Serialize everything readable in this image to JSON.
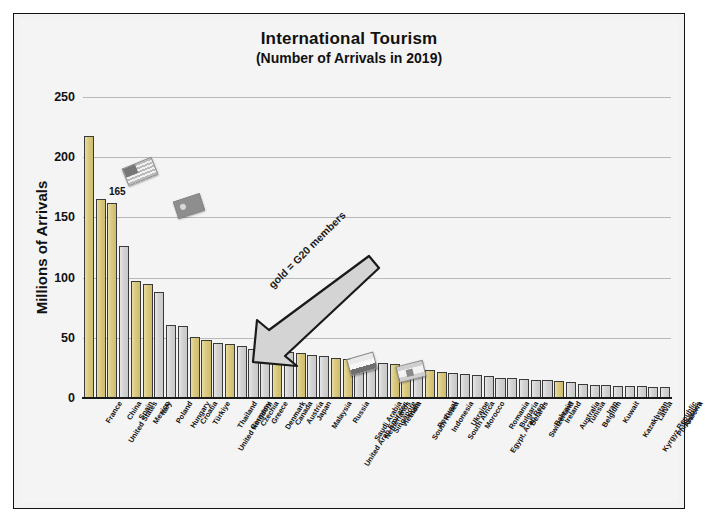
{
  "chart_data": {
    "type": "bar",
    "title": "International Tourism",
    "subtitle": "(Number of Arrivals in 2019)",
    "xlabel": "",
    "ylabel": "Millions of Arrivals",
    "ylim": [
      0,
      250
    ],
    "yticks": [
      0,
      50,
      100,
      150,
      200,
      250
    ],
    "grid": true,
    "legend": false,
    "annotations": [
      {
        "name": "arrow-note",
        "text": "gold = G20 members"
      },
      {
        "name": "data-label-united-states",
        "text": "165",
        "series_index": 1
      }
    ],
    "categories": [
      "France",
      "United States",
      "China",
      "Spain",
      "Mexico",
      "Italy",
      "Poland",
      "Hungary",
      "Croatia",
      "Türkiye",
      "United Kingdom",
      "Thailand",
      "Germany",
      "Czechia",
      "Greece",
      "Denmark",
      "Canada",
      "Austria",
      "Japan",
      "Malaysia",
      "United Arab Emirates",
      "Russia",
      "Saudi Arabia",
      "Netherlands",
      "Singapore",
      "Vietnam",
      "India",
      "South Korea",
      "Portugal",
      "Indonesia",
      "South Africa",
      "Ukraine",
      "Morocco",
      "Egypt, Arab Rep.",
      "Romania",
      "Bulgaria",
      "Belarus",
      "Switzerland",
      "Bahrain",
      "Ireland",
      "Australia",
      "Tunisia",
      "Belgium",
      "Iran",
      "Kuwait",
      "Kazakhstan",
      "Kyrgyz Republic",
      "Latvia",
      "Philippines",
      "Andorra"
    ],
    "values": [
      218,
      165,
      162,
      126,
      97,
      95,
      88,
      61,
      60,
      51,
      48,
      46,
      45,
      43,
      41,
      40,
      39,
      38,
      37,
      36,
      35,
      33,
      32,
      31,
      30,
      29,
      28,
      27,
      25,
      23,
      22,
      21,
      20,
      19,
      18,
      17,
      17,
      16,
      15,
      15,
      14,
      13,
      12,
      11,
      11,
      10,
      10,
      10,
      9,
      9
    ],
    "g20_members": [
      "France",
      "United States",
      "China",
      "Mexico",
      "Italy",
      "Türkiye",
      "United Kingdom",
      "Germany",
      "Canada",
      "Japan",
      "Russia",
      "Saudi Arabia",
      "India",
      "South Korea",
      "Indonesia",
      "South Africa",
      "Australia",
      "Argentina",
      "Brazil"
    ],
    "bar_color_default": "#d2d2d2",
    "bar_color_g20": "#d9c87e",
    "bar_edge_color": "#3a3a3a",
    "grid_color": "#b9b9b9",
    "background_color": "#f2f2f2"
  },
  "figure": {
    "flags": [
      {
        "name": "flag-icon-united-states",
        "country": "United States"
      },
      {
        "name": "flag-icon-china",
        "country": "China"
      },
      {
        "name": "flag-icon-netherlands",
        "country": "Netherlands"
      },
      {
        "name": "flag-icon-spain",
        "country": "Spain"
      }
    ]
  }
}
